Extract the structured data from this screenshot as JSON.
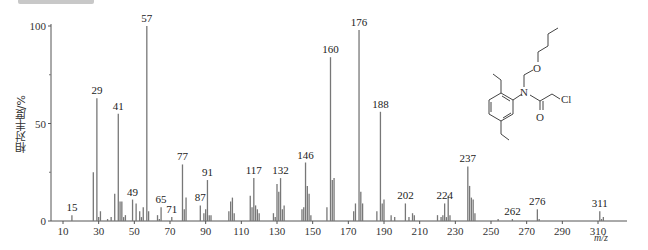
{
  "chart_data": {
    "type": "bar",
    "title": "",
    "xlabel": "m/z",
    "ylabel": "相对丰度/%",
    "xlim": [
      5,
      325
    ],
    "ylim": [
      0,
      100
    ],
    "x_ticks": [
      10,
      30,
      50,
      70,
      90,
      110,
      130,
      150,
      170,
      190,
      210,
      230,
      250,
      270,
      290,
      310
    ],
    "y_ticks": [
      0,
      50,
      100
    ],
    "grid": false,
    "legend": null,
    "labeled_peaks": [
      {
        "mz": 15,
        "intensity": 3
      },
      {
        "mz": 29,
        "intensity": 63
      },
      {
        "mz": 41,
        "intensity": 55
      },
      {
        "mz": 49,
        "intensity": 11
      },
      {
        "mz": 57,
        "intensity": 100
      },
      {
        "mz": 65,
        "intensity": 7
      },
      {
        "mz": 71,
        "intensity": 2
      },
      {
        "mz": 77,
        "intensity": 29
      },
      {
        "mz": 87,
        "intensity": 8
      },
      {
        "mz": 91,
        "intensity": 21
      },
      {
        "mz": 117,
        "intensity": 22
      },
      {
        "mz": 132,
        "intensity": 22
      },
      {
        "mz": 146,
        "intensity": 30
      },
      {
        "mz": 160,
        "intensity": 84
      },
      {
        "mz": 176,
        "intensity": 98
      },
      {
        "mz": 188,
        "intensity": 56
      },
      {
        "mz": 202,
        "intensity": 9
      },
      {
        "mz": 224,
        "intensity": 9
      },
      {
        "mz": 237,
        "intensity": 28
      },
      {
        "mz": 262,
        "intensity": 1
      },
      {
        "mz": 276,
        "intensity": 6
      },
      {
        "mz": 311,
        "intensity": 5
      }
    ],
    "minor_peaks": [
      {
        "mz": 27,
        "intensity": 25
      },
      {
        "mz": 30,
        "intensity": 2
      },
      {
        "mz": 31,
        "intensity": 5
      },
      {
        "mz": 35,
        "intensity": 1
      },
      {
        "mz": 37,
        "intensity": 2
      },
      {
        "mz": 39,
        "intensity": 14
      },
      {
        "mz": 42,
        "intensity": 10
      },
      {
        "mz": 43,
        "intensity": 10
      },
      {
        "mz": 44,
        "intensity": 2
      },
      {
        "mz": 45,
        "intensity": 3
      },
      {
        "mz": 51,
        "intensity": 9
      },
      {
        "mz": 53,
        "intensity": 5
      },
      {
        "mz": 54,
        "intensity": 2
      },
      {
        "mz": 55,
        "intensity": 7
      },
      {
        "mz": 58,
        "intensity": 5
      },
      {
        "mz": 63,
        "intensity": 3
      },
      {
        "mz": 64,
        "intensity": 1
      },
      {
        "mz": 78,
        "intensity": 6
      },
      {
        "mz": 79,
        "intensity": 12
      },
      {
        "mz": 89,
        "intensity": 4
      },
      {
        "mz": 90,
        "intensity": 6
      },
      {
        "mz": 92,
        "intensity": 3
      },
      {
        "mz": 93,
        "intensity": 3
      },
      {
        "mz": 103,
        "intensity": 5
      },
      {
        "mz": 104,
        "intensity": 10
      },
      {
        "mz": 105,
        "intensity": 12
      },
      {
        "mz": 106,
        "intensity": 4
      },
      {
        "mz": 115,
        "intensity": 13
      },
      {
        "mz": 116,
        "intensity": 7
      },
      {
        "mz": 118,
        "intensity": 8
      },
      {
        "mz": 119,
        "intensity": 6
      },
      {
        "mz": 120,
        "intensity": 4
      },
      {
        "mz": 128,
        "intensity": 4
      },
      {
        "mz": 129,
        "intensity": 2
      },
      {
        "mz": 130,
        "intensity": 19
      },
      {
        "mz": 131,
        "intensity": 15
      },
      {
        "mz": 133,
        "intensity": 6
      },
      {
        "mz": 134,
        "intensity": 8
      },
      {
        "mz": 144,
        "intensity": 6
      },
      {
        "mz": 145,
        "intensity": 7
      },
      {
        "mz": 147,
        "intensity": 18
      },
      {
        "mz": 148,
        "intensity": 14
      },
      {
        "mz": 149,
        "intensity": 3
      },
      {
        "mz": 158,
        "intensity": 7
      },
      {
        "mz": 161,
        "intensity": 21
      },
      {
        "mz": 162,
        "intensity": 22
      },
      {
        "mz": 173,
        "intensity": 5
      },
      {
        "mz": 174,
        "intensity": 9
      },
      {
        "mz": 177,
        "intensity": 15
      },
      {
        "mz": 178,
        "intensity": 9
      },
      {
        "mz": 186,
        "intensity": 5
      },
      {
        "mz": 189,
        "intensity": 9
      },
      {
        "mz": 190,
        "intensity": 11
      },
      {
        "mz": 194,
        "intensity": 3
      },
      {
        "mz": 196,
        "intensity": 2
      },
      {
        "mz": 204,
        "intensity": 2
      },
      {
        "mz": 206,
        "intensity": 4
      },
      {
        "mz": 207,
        "intensity": 3
      },
      {
        "mz": 220,
        "intensity": 3
      },
      {
        "mz": 222,
        "intensity": 2
      },
      {
        "mz": 223,
        "intensity": 3
      },
      {
        "mz": 225,
        "intensity": 2
      },
      {
        "mz": 226,
        "intensity": 13
      },
      {
        "mz": 227,
        "intensity": 3
      },
      {
        "mz": 238,
        "intensity": 18
      },
      {
        "mz": 239,
        "intensity": 12
      },
      {
        "mz": 240,
        "intensity": 11
      },
      {
        "mz": 241,
        "intensity": 4
      },
      {
        "mz": 254,
        "intensity": 1
      },
      {
        "mz": 277,
        "intensity": 1
      },
      {
        "mz": 312,
        "intensity": 1
      },
      {
        "mz": 313,
        "intensity": 2
      }
    ]
  },
  "structure": {
    "atoms": [
      "O",
      "N",
      "O",
      "Cl"
    ],
    "compound_hint": "N-(butoxymethyl)-2-chloro-N-(2,6-diethylphenyl)acetamide"
  }
}
